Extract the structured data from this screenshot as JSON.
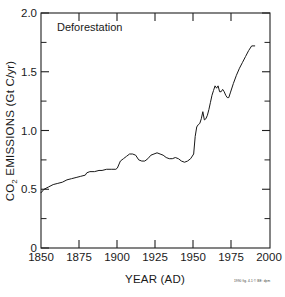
{
  "figure": {
    "title": "Deforestation",
    "credit_text": "1990 fig. 4.1 © BE: dpm"
  },
  "chart_data": {
    "type": "line",
    "title": "Deforestation",
    "xlabel": "YEAR (AD)",
    "ylabel": "CO2 EMISSIONS (Gt C/yr)",
    "ylabel_parts": {
      "prefix": "CO",
      "subscript": "2",
      "suffix": " EMISSIONS (Gt C/yr)"
    },
    "xlim": [
      1850,
      2000
    ],
    "ylim": [
      0,
      2.0
    ],
    "grid": false,
    "legend": "none",
    "x_ticks_major": [
      1850,
      1875,
      1900,
      1925,
      1950,
      1975,
      2000
    ],
    "x_tick_labels": [
      "1850",
      "1875",
      "1900",
      "1925",
      "1950",
      "1975",
      "2000"
    ],
    "y_ticks_major": [
      0,
      0.5,
      1.0,
      1.5,
      2.0
    ],
    "y_tick_labels": [
      "0",
      "0.5",
      "1.0",
      "1.5",
      "2.0"
    ],
    "y_ticks_minor": [
      0.25,
      0.75,
      1.25,
      1.75
    ],
    "series": [
      {
        "name": "Deforestation CO2 emissions",
        "units": "Gt C/yr",
        "x": [
          1850,
          1852,
          1855,
          1858,
          1861,
          1864,
          1867,
          1870,
          1873,
          1876,
          1879,
          1880,
          1882,
          1885,
          1888,
          1890,
          1893,
          1896,
          1899,
          1900,
          1902,
          1904,
          1906,
          1908,
          1910,
          1912,
          1914,
          1916,
          1918,
          1920,
          1922,
          1924,
          1926,
          1928,
          1930,
          1932,
          1934,
          1936,
          1938,
          1940,
          1942,
          1944,
          1946,
          1948,
          1950,
          1951,
          1952,
          1953,
          1954,
          1955,
          1956,
          1957,
          1958,
          1959,
          1960,
          1961,
          1962,
          1963,
          1964,
          1965,
          1966,
          1967,
          1968,
          1969,
          1970,
          1971,
          1972,
          1973,
          1974,
          1976,
          1978,
          1980,
          1982,
          1984,
          1986,
          1988,
          1990
        ],
        "y": [
          0.47,
          0.5,
          0.52,
          0.54,
          0.55,
          0.56,
          0.58,
          0.59,
          0.6,
          0.61,
          0.62,
          0.64,
          0.65,
          0.65,
          0.66,
          0.66,
          0.67,
          0.67,
          0.67,
          0.68,
          0.74,
          0.76,
          0.78,
          0.8,
          0.8,
          0.79,
          0.75,
          0.74,
          0.74,
          0.76,
          0.79,
          0.8,
          0.81,
          0.8,
          0.79,
          0.77,
          0.76,
          0.76,
          0.77,
          0.76,
          0.74,
          0.73,
          0.74,
          0.76,
          0.8,
          0.95,
          1.03,
          1.05,
          1.06,
          1.1,
          1.16,
          1.09,
          1.1,
          1.13,
          1.18,
          1.24,
          1.3,
          1.34,
          1.38,
          1.36,
          1.38,
          1.33,
          1.33,
          1.35,
          1.33,
          1.3,
          1.28,
          1.28,
          1.32,
          1.4,
          1.47,
          1.53,
          1.58,
          1.63,
          1.68,
          1.72,
          1.72
        ]
      }
    ]
  }
}
